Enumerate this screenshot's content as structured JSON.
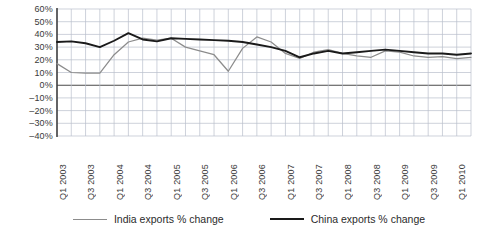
{
  "chart_data": {
    "type": "line",
    "title": "",
    "subtitle": "",
    "xlabel": "",
    "ylabel": "",
    "grid": true,
    "legend_position": "bottom",
    "ylim": [
      -40,
      60
    ],
    "ytick_labels": [
      "60%",
      "50%",
      "40%",
      "30%",
      "20%",
      "10%",
      "0%",
      "–10%",
      "–20%",
      "–30%",
      "–40%"
    ],
    "ytick_values": [
      60,
      50,
      40,
      30,
      20,
      10,
      0,
      -10,
      -20,
      -30,
      -40
    ],
    "categories": [
      "Q1 2003",
      "Q2 2003",
      "Q3 2003",
      "Q4 2003",
      "Q1 2004",
      "Q2 2004",
      "Q3 2004",
      "Q4 2004",
      "Q1 2005",
      "Q2 2005",
      "Q3 2005",
      "Q4 2005",
      "Q1 2006",
      "Q2 2006",
      "Q3 2006",
      "Q4 2006",
      "Q1 2007",
      "Q2 2007",
      "Q3 2007",
      "Q4 2007",
      "Q1 2008",
      "Q2 2008",
      "Q3 2008",
      "Q4 2008",
      "Q1 2009",
      "Q2 2009",
      "Q3 2009",
      "Q4 2009",
      "Q1 2010",
      "Q2 2010"
    ],
    "xtick_labels": [
      "Q1 2003",
      "Q3 2003",
      "Q1 2004",
      "Q3 2004",
      "Q1 2005",
      "Q3 2005",
      "Q1 2006",
      "Q3 2006",
      "Q1 2007",
      "Q3 2007",
      "Q1 2008",
      "Q3 2008",
      "Q1 2009",
      "Q3 2009",
      "Q1 2010"
    ],
    "series": [
      {
        "name": "India exports % change",
        "color": "#8c8c8c",
        "values": [
          17,
          10,
          9.5,
          9.5,
          24,
          34,
          37,
          35.5,
          37,
          30,
          27,
          24,
          11,
          29,
          38,
          34,
          25,
          21,
          26,
          28,
          25,
          23,
          22,
          27,
          26,
          23,
          22,
          22.5,
          21,
          22
        ]
      },
      {
        "name": "China exports % change",
        "color": "#1a1a1a",
        "values": [
          34,
          34.5,
          33,
          30,
          35,
          41,
          36,
          34.5,
          37,
          36.5,
          36,
          35.5,
          35,
          34,
          32,
          30,
          27,
          22,
          25,
          27,
          25,
          26,
          27,
          28,
          27,
          26,
          25,
          25,
          24,
          25
        ]
      }
    ],
    "series_values_india": [
      17,
      10,
      9.5,
      9.5,
      24,
      34,
      37,
      35.5,
      37,
      30,
      27,
      24,
      11,
      29,
      38,
      34,
      25,
      21,
      26,
      28,
      25,
      23,
      22,
      27,
      26,
      23,
      22,
      22.5,
      21,
      22
    ],
    "annotations": []
  },
  "legend": {
    "entries": [
      {
        "label": "India exports % change",
        "color": "#8c8c8c"
      },
      {
        "label": "China exports % change",
        "color": "#1a1a1a"
      }
    ]
  },
  "axes": {
    "y_min": -40,
    "y_max": 60,
    "y_step": 10
  }
}
